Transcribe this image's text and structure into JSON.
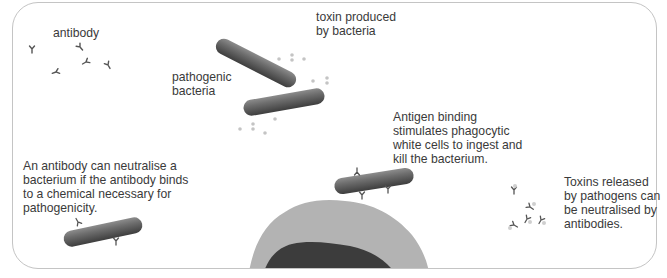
{
  "diagram": {
    "labels": {
      "antibody": "antibody",
      "pathogenic_bacteria": "pathogenic\nbacteria",
      "toxin": "toxin produced\nby bacteria",
      "phagocytosis": "Antigen binding\nstimulates phagocytic\nwhite cells to ingest and\nkill the bacterium.",
      "neutralise_bacterium": "An antibody can neutralise a\nbacterium if the antibody binds\nto a chemical necessary for\npathogenicity.",
      "neutralise_toxin": "Toxins released\nby pathogens can\nbe neutralised by\nantibodies."
    },
    "colors": {
      "border": "#c4c4c4",
      "bacterium_dark": "#4a4a4a",
      "bacterium_light": "#8a8a8a",
      "cell_outer": "#b5b5b5",
      "cell_nucleus": "#3c3c3c",
      "toxin_dot": "#c8c8c8",
      "text": "#3a3a3a"
    }
  }
}
